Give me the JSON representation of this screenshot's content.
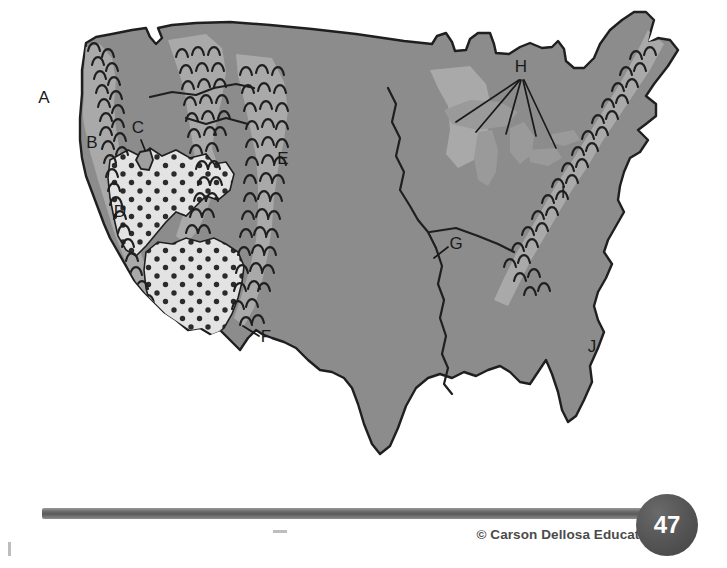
{
  "page": {
    "number": "47",
    "credit": "© Carson Dellosa Education"
  },
  "map": {
    "name": "united-states-landforms-map",
    "colors": {
      "land": "#8c8c8c",
      "highland": "#a9a9a9",
      "desert": "#e3e3e3",
      "desert_dot": "#2b2b2b",
      "outline": "#1f1f1f",
      "river": "#1f1f1f",
      "ocean": "#ffffff",
      "label": "#1a1a1a",
      "rule": "#6f6f6f",
      "badge": "#4d4d4d"
    },
    "labels": [
      {
        "id": "A",
        "text": "A",
        "x": 44,
        "y": 103,
        "leader": false,
        "region": "pacific-ocean"
      },
      {
        "id": "B",
        "text": "B",
        "x": 92,
        "y": 148,
        "leader": false,
        "region": "coastal-ranges"
      },
      {
        "id": "C",
        "text": "C",
        "x": 136,
        "y": 133,
        "leader": true,
        "region": "great-salt-lake",
        "leader_path": "M141 138 L144 150"
      },
      {
        "id": "D",
        "text": "D",
        "x": 120,
        "y": 217,
        "leader": false,
        "region": "great-basin-desert"
      },
      {
        "id": "E",
        "text": "E",
        "x": 280,
        "y": 163,
        "leader": false,
        "region": "rocky-mountains"
      },
      {
        "id": "F",
        "text": "F",
        "x": 262,
        "y": 341,
        "leader": true,
        "region": "sierra-sonoran-edge",
        "leader_path": "M258 336 L243 326"
      },
      {
        "id": "G",
        "text": "G",
        "x": 452,
        "y": 248,
        "leader": true,
        "region": "mississippi-river",
        "leader_path": "M449 247 L435 257"
      },
      {
        "id": "H",
        "text": "H",
        "x": 515,
        "y": 71,
        "leader": true,
        "region": "great-lakes",
        "leader_path": "M520 79 L455 122 M521 79 L474 132 M522 79 L505 133 M524 79 L535 135 M525 79 L553 146"
      },
      {
        "id": "I",
        "text": "I",
        "x": 561,
        "y": 197,
        "leader": false,
        "region": "appalachian-mountains"
      },
      {
        "id": "J",
        "text": "J",
        "x": 590,
        "y": 352,
        "leader": false,
        "region": "atlantic-ocean"
      }
    ],
    "features": {
      "mountain_symbol": "arc-chevron",
      "desert_symbol": "dot-stipple",
      "river_symbol": "thin-line",
      "lake_symbol": "filled-outline"
    }
  }
}
